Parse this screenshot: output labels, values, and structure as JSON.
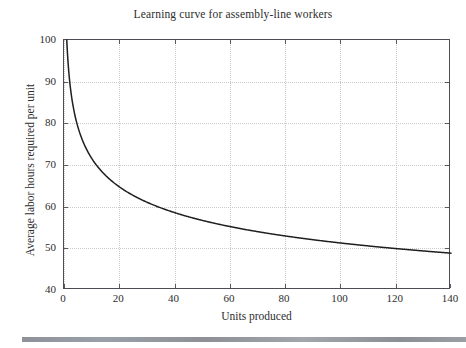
{
  "figure": {
    "title": "Learning curve for assembly-line workers",
    "background_color": "#ffffff",
    "frame_color": "#4c4c55",
    "grid_color": "#c9c9cf",
    "curve_color": "#1f1f1f",
    "page_edge_bar_color": "#93969d"
  },
  "axes": {
    "x_label": "Units produced",
    "y_label": "Average labor hours required per unit",
    "x_ticks": [
      "0",
      "20",
      "40",
      "60",
      "80",
      "100",
      "120",
      "140"
    ],
    "y_ticks": [
      "40",
      "50",
      "60",
      "70",
      "80",
      "90",
      "100"
    ]
  },
  "chart_data": {
    "type": "line",
    "title": "Learning curve for assembly-line workers",
    "xlabel": "Units produced",
    "ylabel": "Average labor hours required per unit",
    "xlim": [
      0,
      140
    ],
    "ylim": [
      40,
      100
    ],
    "xticks": [
      0,
      20,
      40,
      60,
      80,
      100,
      120,
      140
    ],
    "yticks": [
      40,
      50,
      60,
      70,
      80,
      90,
      100
    ],
    "grid": true,
    "legend": "none",
    "series": [
      {
        "name": "Average labor hours per unit",
        "formula": "y = 100 * x^(-0.145)",
        "x": [
          1,
          2,
          3,
          4,
          5,
          6,
          8,
          10,
          12,
          15,
          20,
          25,
          30,
          35,
          40,
          50,
          60,
          70,
          80,
          90,
          100,
          110,
          120,
          130,
          140
        ],
        "y": [
          100.0,
          90.4,
          85.3,
          81.8,
          79.1,
          77.0,
          73.9,
          71.6,
          69.7,
          67.5,
          64.7,
          62.6,
          61.0,
          59.6,
          58.5,
          56.6,
          55.2,
          54.1,
          53.1,
          52.3,
          51.6,
          50.9,
          50.3,
          49.8,
          49.3
        ]
      }
    ],
    "data_points_labeled": [
      {
        "x": 0,
        "y": 100
      },
      {
        "x": 20,
        "y": 64.7
      },
      {
        "x": 40,
        "y": 58.5
      },
      {
        "x": 60,
        "y": 55.2
      },
      {
        "x": 80,
        "y": 53.1
      },
      {
        "x": 100,
        "y": 51.6
      },
      {
        "x": 120,
        "y": 50.3
      },
      {
        "x": 140,
        "y": 49.3
      }
    ]
  }
}
